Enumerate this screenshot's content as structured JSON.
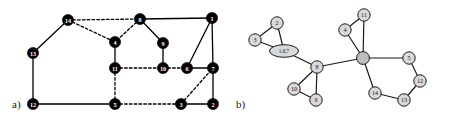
{
  "figure": {
    "width": 451,
    "height": 125,
    "background": "#ffffff",
    "panels": [
      {
        "id": "a",
        "caption": "a)",
        "caption_pos": {
          "x": 12,
          "y": 108
        },
        "style": {
          "node_fill": "#000000",
          "node_stroke": "#000000",
          "node_r": 5.6,
          "label_color": "#ffffff",
          "edge_color": "#000000",
          "edge_width": 1.3,
          "dash_pattern": "2.6,2.2"
        },
        "nodes": [
          {
            "id": "14",
            "label": "14",
            "x": 68,
            "y": 20
          },
          {
            "id": "8",
            "label": "8",
            "x": 140,
            "y": 19
          },
          {
            "id": "1",
            "label": "1",
            "x": 212,
            "y": 18
          },
          {
            "id": "13",
            "label": "13",
            "x": 33,
            "y": 53
          },
          {
            "id": "4",
            "label": "4",
            "x": 115,
            "y": 42
          },
          {
            "id": "9",
            "label": "9",
            "x": 163,
            "y": 43
          },
          {
            "id": "11",
            "label": "11",
            "x": 115,
            "y": 68
          },
          {
            "id": "10",
            "label": "10",
            "x": 163,
            "y": 68
          },
          {
            "id": "6",
            "label": "6",
            "x": 187,
            "y": 68
          },
          {
            "id": "7",
            "label": "7",
            "x": 213,
            "y": 68
          },
          {
            "id": "12",
            "label": "12",
            "x": 33,
            "y": 104
          },
          {
            "id": "5",
            "label": "5",
            "x": 115,
            "y": 104
          },
          {
            "id": "3",
            "label": "3",
            "x": 181,
            "y": 104
          },
          {
            "id": "2",
            "label": "2",
            "x": 213,
            "y": 104
          }
        ],
        "edges": [
          {
            "from": "14",
            "to": "13",
            "style": "solid"
          },
          {
            "from": "14",
            "to": "8",
            "style": "dashed"
          },
          {
            "from": "14",
            "to": "4",
            "style": "dashed"
          },
          {
            "from": "8",
            "to": "4",
            "style": "dashed"
          },
          {
            "from": "8",
            "to": "9",
            "style": "solid"
          },
          {
            "from": "8",
            "to": "1",
            "style": "solid"
          },
          {
            "from": "1",
            "to": "6",
            "style": "solid"
          },
          {
            "from": "1",
            "to": "7",
            "style": "solid"
          },
          {
            "from": "4",
            "to": "11",
            "style": "solid"
          },
          {
            "from": "9",
            "to": "10",
            "style": "solid"
          },
          {
            "from": "11",
            "to": "10",
            "style": "dashed"
          },
          {
            "from": "10",
            "to": "6",
            "style": "dashed"
          },
          {
            "from": "6",
            "to": "7",
            "style": "solid"
          },
          {
            "from": "11",
            "to": "5",
            "style": "dashed"
          },
          {
            "from": "13",
            "to": "12",
            "style": "solid"
          },
          {
            "from": "12",
            "to": "5",
            "style": "solid"
          },
          {
            "from": "5",
            "to": "3",
            "style": "dashed"
          },
          {
            "from": "3",
            "to": "7",
            "style": "dashed"
          },
          {
            "from": "3",
            "to": "2",
            "style": "solid"
          },
          {
            "from": "2",
            "to": "7",
            "style": "solid"
          }
        ]
      },
      {
        "id": "b",
        "caption": "b)",
        "caption_pos": {
          "x": 236,
          "y": 108
        },
        "style": {
          "node_fill": "#d9d9d9",
          "node_stroke": "#1a1a1a",
          "node_r": 6.2,
          "hub_fill": "#bdbdbd",
          "hub_r": 6.4,
          "label_color": "#111111",
          "edge_color": "#1a1a1a",
          "edge_width": 1.2
        },
        "nodes": [
          {
            "id": "n2",
            "label": "2",
            "shape": "circle",
            "x": 277,
            "y": 23
          },
          {
            "id": "n3",
            "label": "3",
            "shape": "circle",
            "x": 255,
            "y": 40
          },
          {
            "id": "n167",
            "label": "1,6,7",
            "shape": "ellipse",
            "x": 284,
            "y": 51,
            "rx": 14.5,
            "ry": 6.3
          },
          {
            "id": "n8",
            "label": "8",
            "shape": "circle",
            "x": 317,
            "y": 67
          },
          {
            "id": "n10",
            "label": "10",
            "shape": "circle",
            "x": 294,
            "y": 89
          },
          {
            "id": "n9",
            "label": "9",
            "shape": "circle",
            "x": 316,
            "y": 100
          },
          {
            "id": "hub",
            "label": "",
            "shape": "circle",
            "x": 363,
            "y": 58,
            "hub": true
          },
          {
            "id": "n4",
            "label": "4",
            "shape": "circle",
            "x": 345,
            "y": 30
          },
          {
            "id": "n11",
            "label": "11",
            "shape": "circle",
            "x": 364,
            "y": 15
          },
          {
            "id": "n5",
            "label": "5",
            "shape": "circle",
            "x": 409,
            "y": 58
          },
          {
            "id": "n12",
            "label": "12",
            "shape": "circle",
            "x": 420,
            "y": 81
          },
          {
            "id": "n13",
            "label": "13",
            "shape": "circle",
            "x": 404,
            "y": 100
          },
          {
            "id": "n14",
            "label": "14",
            "shape": "circle",
            "x": 375,
            "y": 93
          }
        ],
        "edges": [
          {
            "from": "n2",
            "to": "n3",
            "style": "solid"
          },
          {
            "from": "n2",
            "to": "n167",
            "style": "solid"
          },
          {
            "from": "n3",
            "to": "n167",
            "style": "solid"
          },
          {
            "from": "n167",
            "to": "n8",
            "style": "solid"
          },
          {
            "from": "n8",
            "to": "n10",
            "style": "solid"
          },
          {
            "from": "n8",
            "to": "n9",
            "style": "solid"
          },
          {
            "from": "n10",
            "to": "n9",
            "style": "solid"
          },
          {
            "from": "n8",
            "to": "hub",
            "style": "solid"
          },
          {
            "from": "hub",
            "to": "n4",
            "style": "solid"
          },
          {
            "from": "hub",
            "to": "n11",
            "style": "solid"
          },
          {
            "from": "n4",
            "to": "n11",
            "style": "solid"
          },
          {
            "from": "hub",
            "to": "n5",
            "style": "solid"
          },
          {
            "from": "n5",
            "to": "n12",
            "style": "solid"
          },
          {
            "from": "n12",
            "to": "n13",
            "style": "solid"
          },
          {
            "from": "n13",
            "to": "n14",
            "style": "solid"
          },
          {
            "from": "n14",
            "to": "hub",
            "style": "solid"
          }
        ]
      }
    ]
  }
}
